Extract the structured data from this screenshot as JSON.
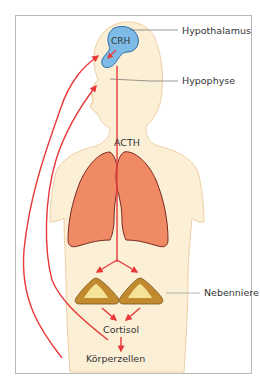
{
  "figure": {
    "type": "hormone-regulation-diagram",
    "labels": {
      "crh": "CRH",
      "hypothalamus": "Hypothalamus",
      "hypophyse": "Hypophyse",
      "acth": "ACTH",
      "nebenniere": "Nebenniere",
      "cortisol": "Cortisol",
      "koerperzellen": "Körperzellen"
    },
    "colors": {
      "frame": "#b8b8b8",
      "skin": "#fbefd6",
      "skin_outline": "#efcfa6",
      "brain": "#7dbbe6",
      "brain_outline": "#2f6fa8",
      "lung": "#f08a64",
      "lung_outline": "#7a2a22",
      "arrow": "#e8393a",
      "gland_outer": "#c28a2e",
      "gland_inner": "#f4e49a",
      "leader_line": "#555555"
    }
  }
}
